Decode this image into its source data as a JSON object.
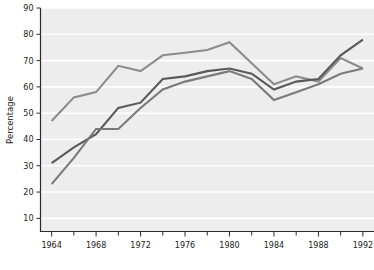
{
  "chart_data": {
    "type": "line",
    "title": "",
    "subtitle": "",
    "xlabel": "",
    "ylabel": "Percentage",
    "xlim": [
      1963,
      1993
    ],
    "ylim": [
      5,
      90
    ],
    "grid": "horizontal-white",
    "legend": "none",
    "x": [
      1964,
      1966,
      1968,
      1970,
      1972,
      1974,
      1976,
      1978,
      1980,
      1982,
      1984,
      1986,
      1988,
      1990,
      1992
    ],
    "xticks": [
      1964,
      1968,
      1972,
      1976,
      1980,
      1984,
      1988,
      1992
    ],
    "xtick_labels": [
      "1964",
      "1968",
      "1972",
      "1976",
      "1980",
      "1984",
      "1988",
      "1992"
    ],
    "xminor_ticks": [
      1966,
      1970,
      1974,
      1978,
      1982,
      1986,
      1990
    ],
    "yticks": [
      10,
      20,
      30,
      40,
      50,
      60,
      70,
      80,
      90
    ],
    "ytick_labels": [
      "10",
      "20",
      "30",
      "40",
      "50",
      "60",
      "70",
      "80",
      "90"
    ],
    "series": [
      {
        "name": "series-1",
        "color": "#8c8c8c",
        "values": [
          47,
          56,
          58,
          68,
          66,
          72,
          73,
          74,
          77,
          69,
          61,
          64,
          62,
          71,
          67
        ]
      },
      {
        "name": "series-2",
        "color": "#595959",
        "values": [
          31,
          37,
          42,
          52,
          54,
          63,
          64,
          66,
          67,
          65,
          59,
          62,
          63,
          72,
          78
        ]
      },
      {
        "name": "series-3",
        "color": "#7a7a7a",
        "values": [
          23,
          33,
          44,
          44,
          52,
          59,
          62,
          64,
          66,
          63,
          55,
          58,
          61,
          65,
          67
        ]
      }
    ]
  },
  "axes": {
    "y_axis_title": "Percentage"
  },
  "colors": {
    "plot_background": "#ededed",
    "page_background": "#ffffff",
    "gridline": "#ffffff",
    "axis": "#2b2b2b",
    "tick_text": "#1a1a1a"
  }
}
